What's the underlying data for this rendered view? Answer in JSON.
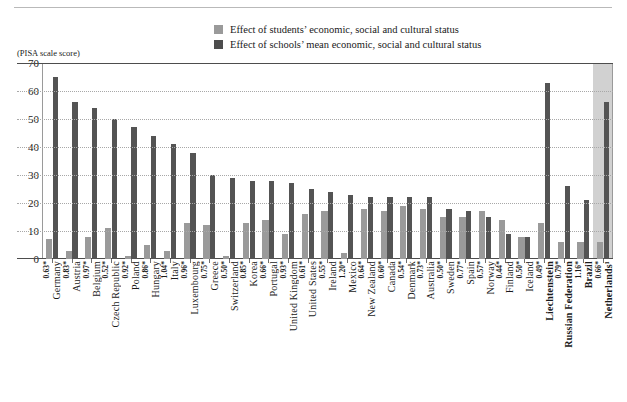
{
  "legend": {
    "items": [
      {
        "label": "Effect of students’ economic, social and cultural status",
        "color": "#9a9a9a",
        "icon": "legend-swatch-light"
      },
      {
        "label": "Effect of schools’ mean economic, social and cultural status",
        "color": "#4d4d4d",
        "icon": "legend-swatch-dark"
      }
    ]
  },
  "axis_caption": "(PISA scale score)",
  "chart_data": {
    "type": "bar",
    "title": "",
    "subtitle": "",
    "xlabel": "",
    "ylabel": "(PISA scale score)",
    "ylim": [
      0,
      70
    ],
    "yticks": [
      0,
      10,
      20,
      30,
      40,
      50,
      60,
      70
    ],
    "ytick_labels": [
      "0",
      "10",
      "20",
      "30",
      "40",
      "50",
      "60",
      "70"
    ],
    "grid": true,
    "legend_position": "top-center",
    "highlight": {
      "category": "Netherlands¹",
      "color": "#c9c9c9"
    },
    "categories": [
      "Germany",
      "Austria",
      "Belgium",
      "Czech Republic",
      "Poland",
      "Hungary",
      "Italy",
      "Luxembourg",
      "Greece",
      "Switzerland",
      "Korea",
      "Portugal",
      "United Kingdom",
      "United States",
      "Ireland",
      "Mexico",
      "New Zealand",
      "Canada",
      "Denmark",
      "Australia",
      "Sweden",
      "Spain",
      "Norway",
      "Finland",
      "Iceland",
      "Liechtenstein",
      "Russian Federation",
      "Brazil",
      "Netherlands¹"
    ],
    "category_values": [
      "0.63*",
      "0.83*",
      "0.97*",
      "0.52*",
      "0.92*",
      "0.86*",
      "1.04*",
      "0.96*",
      "0.75*",
      "0.50*",
      "0.85*",
      "0.66*",
      "0.93*",
      "0.61*",
      "0.55*",
      "1.20*",
      "0.64*",
      "0.60*",
      "0.54*",
      "0.73*",
      "0.50*",
      "0.77*",
      "0.57*",
      "0.44*",
      "0.50*",
      "0.49*",
      "0.79*",
      "1.16*",
      "0.66*"
    ],
    "bold_categories": [
      "Liechtenstein",
      "Russian Federation",
      "Brazil",
      "Netherlands¹"
    ],
    "series": [
      {
        "name": "Effect of students’ economic, social and cultural status",
        "color": "#9a9a9a",
        "values": [
          7,
          3,
          8,
          11,
          1,
          5,
          3,
          13,
          12,
          1,
          13,
          14,
          9,
          16,
          17,
          2,
          18,
          17,
          19,
          18,
          15,
          15,
          17,
          14,
          8,
          13,
          6,
          6,
          6
        ]
      },
      {
        "name": "Effect of schools’ mean economic, social and cultural status",
        "color": "#545454",
        "values": [
          65,
          56,
          54,
          50,
          47,
          44,
          41,
          38,
          30,
          29,
          28,
          28,
          27,
          25,
          24,
          23,
          22,
          22,
          22,
          22,
          18,
          17,
          15,
          9,
          8,
          63,
          26,
          21,
          56
        ]
      }
    ]
  }
}
